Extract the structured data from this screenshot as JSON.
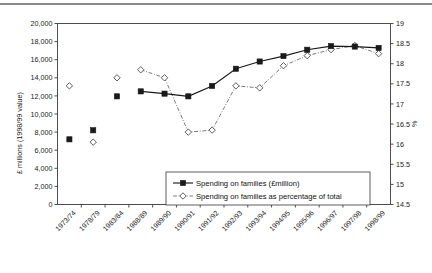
{
  "chart_data": {
    "type": "line",
    "title": "",
    "xlabel": "",
    "ylabel": "£ millions (1998/99 value)",
    "y2label": "%",
    "ylim": [
      0,
      20000
    ],
    "y2lim": [
      14.5,
      19
    ],
    "grid": false,
    "legend_position": "inside-bottom-center",
    "categories": [
      "1973/74",
      "1978/79",
      "1983/84",
      "1988/89",
      "1989/90",
      "1990/91",
      "1991/92",
      "1992/93",
      "1993/94",
      "1994/95",
      "1995/96",
      "1996/97",
      "1997/98",
      "1998/99"
    ],
    "yticks": [
      "0",
      "2,000",
      "4,000",
      "6,000",
      "8,000",
      "10,000",
      "12,000",
      "14,000",
      "16,000",
      "18,000",
      "20,000"
    ],
    "y2ticks": [
      "14.5",
      "15",
      "15.5",
      "16",
      "16.5",
      "17",
      "17.5",
      "18",
      "18.5",
      "19"
    ],
    "series": [
      {
        "name": "Spending on families (£million)",
        "axis": "left",
        "marker": "filled-square",
        "linestyle": "solid",
        "color": "#1a1a1a",
        "connected_from_index": 3,
        "values": [
          7200,
          8200,
          null,
          12500,
          12250,
          11950,
          13100,
          15000,
          15800,
          16400,
          17100,
          17500,
          17450,
          17300
        ],
        "isolated_points": {
          "2": 11950
        }
      },
      {
        "name": "Spending on families as percentage of total",
        "axis": "right",
        "marker": "open-diamond",
        "linestyle": "dash-dot",
        "color": "#6b6b6b",
        "connected_from_index": 3,
        "values": [
          17.45,
          16.05,
          17.65,
          17.85,
          17.65,
          16.3,
          16.35,
          17.45,
          17.4,
          17.95,
          18.2,
          18.35,
          18.45,
          18.25
        ]
      }
    ]
  },
  "legend": {
    "entries": [
      {
        "label": "Spending on families (£million)"
      },
      {
        "label": "Spending on families as percentage of total"
      }
    ]
  }
}
